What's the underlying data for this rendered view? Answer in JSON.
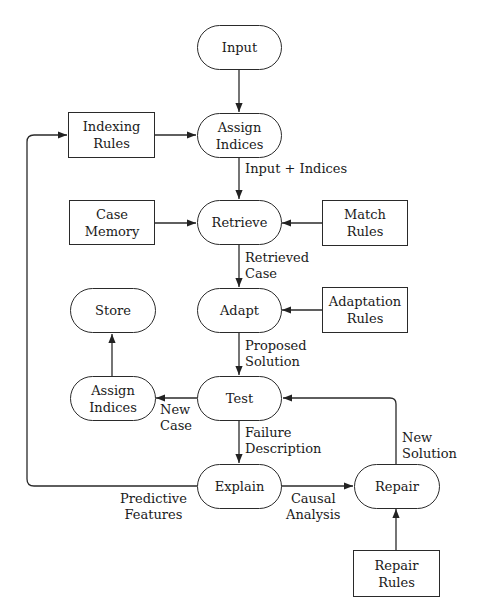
{
  "diagram": {
    "type": "flowchart",
    "nodes": {
      "input": {
        "shape": "oval",
        "lines": [
          "Input"
        ]
      },
      "assign_indices_top": {
        "shape": "oval",
        "lines": [
          "Assign",
          "Indices"
        ]
      },
      "indexing_rules": {
        "shape": "rect",
        "lines": [
          "Indexing",
          "Rules"
        ]
      },
      "case_memory": {
        "shape": "rect",
        "lines": [
          "Case",
          "Memory"
        ]
      },
      "retrieve": {
        "shape": "oval",
        "lines": [
          "Retrieve"
        ]
      },
      "match_rules": {
        "shape": "rect",
        "lines": [
          "Match",
          "Rules"
        ]
      },
      "store": {
        "shape": "oval",
        "lines": [
          "Store"
        ]
      },
      "adapt": {
        "shape": "oval",
        "lines": [
          "Adapt"
        ]
      },
      "adaptation_rules": {
        "shape": "rect",
        "lines": [
          "Adaptation",
          "Rules"
        ]
      },
      "assign_indices_bottom": {
        "shape": "oval",
        "lines": [
          "Assign",
          "Indices"
        ]
      },
      "test": {
        "shape": "oval",
        "lines": [
          "Test"
        ]
      },
      "explain": {
        "shape": "oval",
        "lines": [
          "Explain"
        ]
      },
      "repair": {
        "shape": "oval",
        "lines": [
          "Repair"
        ]
      },
      "repair_rules": {
        "shape": "rect",
        "lines": [
          "Repair",
          "Rules"
        ]
      }
    },
    "edge_labels": {
      "input_indices": "Input + Indices",
      "retrieved_case": [
        "Retrieved",
        "Case"
      ],
      "proposed_solution": [
        "Proposed",
        "Solution"
      ],
      "new_case": [
        "New",
        "Case"
      ],
      "failure_description": [
        "Failure",
        "Description"
      ],
      "new_solution": [
        "New",
        "Solution"
      ],
      "predictive_features": [
        "Predictive",
        "Features"
      ],
      "causal_analysis": [
        "Causal",
        "Analysis"
      ]
    },
    "edges": [
      {
        "from": "input",
        "to": "assign_indices_top"
      },
      {
        "from": "indexing_rules",
        "to": "assign_indices_top"
      },
      {
        "from": "assign_indices_top",
        "to": "retrieve",
        "label": "Input + Indices"
      },
      {
        "from": "case_memory",
        "to": "retrieve"
      },
      {
        "from": "match_rules",
        "to": "retrieve"
      },
      {
        "from": "retrieve",
        "to": "adapt",
        "label": "Retrieved Case"
      },
      {
        "from": "adaptation_rules",
        "to": "adapt"
      },
      {
        "from": "adapt",
        "to": "test",
        "label": "Proposed Solution"
      },
      {
        "from": "test",
        "to": "assign_indices_bottom",
        "label": "New Case"
      },
      {
        "from": "assign_indices_bottom",
        "to": "store"
      },
      {
        "from": "test",
        "to": "explain",
        "label": "Failure Description"
      },
      {
        "from": "explain",
        "to": "repair",
        "label": "Causal Analysis"
      },
      {
        "from": "repair",
        "to": "test",
        "label": "New Solution"
      },
      {
        "from": "repair_rules",
        "to": "repair"
      },
      {
        "from": "explain",
        "to": "indexing_rules",
        "label": "Predictive Features"
      }
    ]
  }
}
